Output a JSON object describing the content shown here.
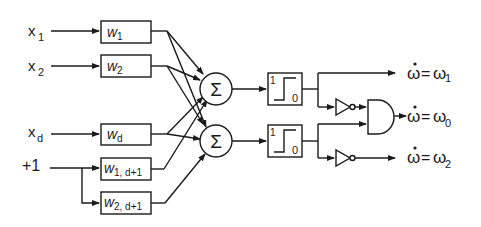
{
  "diagram": {
    "type": "neural-network-classifier",
    "inputs": [
      {
        "name": "x",
        "sub": "1"
      },
      {
        "name": "x",
        "sub": "2"
      },
      {
        "name": "x",
        "sub": "d"
      },
      {
        "name": "+1",
        "sub": ""
      }
    ],
    "weights": [
      {
        "name": "w",
        "sub": "1"
      },
      {
        "name": "w",
        "sub": "2"
      },
      {
        "name": "w",
        "sub": "d"
      },
      {
        "name": "w",
        "sub": "1, d+1"
      },
      {
        "name": "w",
        "sub": "2, d+1"
      }
    ],
    "summers": [
      {
        "symbol": "Σ"
      },
      {
        "symbol": "Σ"
      }
    ],
    "thresholds": [
      {
        "high": "1",
        "low": "0"
      },
      {
        "high": "1",
        "low": "0"
      }
    ],
    "outputs": [
      {
        "lhs": "ω",
        "rhs": "ω",
        "sub": "1"
      },
      {
        "lhs": "ω",
        "rhs": "ω",
        "sub": "0"
      },
      {
        "lhs": "ω",
        "rhs": "ω",
        "sub": "2"
      }
    ],
    "equals": "="
  }
}
